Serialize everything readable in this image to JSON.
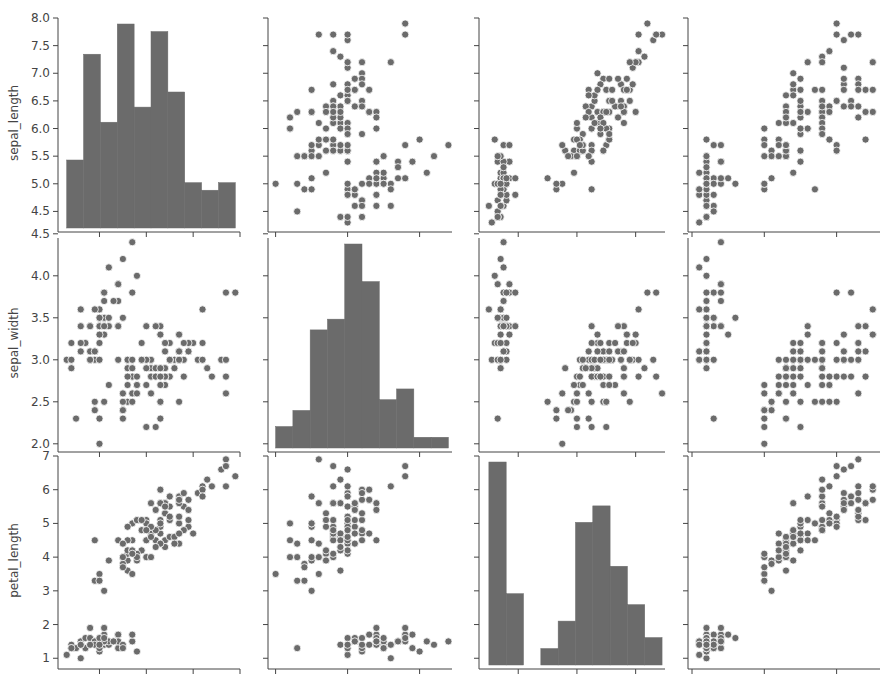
{
  "colors": {
    "bar": "#6b6b6b",
    "marker": "#6b6b6b",
    "marker_edge": "#ffffff",
    "axis": "#444444"
  },
  "chart_data": {
    "type": "pairplot",
    "title": "",
    "rows": [
      "sepal_length",
      "sepal_width",
      "petal_length"
    ],
    "cols": [
      "sepal_length",
      "sepal_width",
      "petal_length",
      "petal_width"
    ],
    "legend": null,
    "grid": false,
    "axes": {
      "sepal_length": {
        "range": [
          4.2,
          8.0
        ],
        "ticks": [
          "4.5",
          "5.0",
          "5.5",
          "6.0",
          "6.5",
          "7.0",
          "7.5",
          "8.0"
        ],
        "xticks": [
          5,
          6,
          7,
          8
        ]
      },
      "sepal_width": {
        "range": [
          1.95,
          4.45
        ],
        "ticks": [
          "2.0",
          "2.5",
          "3.0",
          "3.5",
          "4.0",
          "4.5"
        ],
        "xticks": [
          2,
          3,
          4
        ]
      },
      "petal_length": {
        "range": [
          0.8,
          7.0
        ],
        "ticks": [
          "1",
          "2",
          "3",
          "4",
          "5",
          "6",
          "7"
        ],
        "xticks": [
          2,
          4,
          6
        ]
      },
      "petal_width": {
        "range": [
          0.0,
          2.6
        ],
        "ticks": [],
        "xticks": [
          0,
          1,
          2
        ]
      }
    },
    "histograms": {
      "sepal_length": {
        "bins": [
          4.3,
          4.66,
          5.02,
          5.38,
          5.74,
          6.1,
          6.46,
          6.82,
          7.18,
          7.54,
          7.9
        ],
        "counts": [
          9,
          23,
          14,
          27,
          16,
          26,
          18,
          6,
          5,
          6
        ]
      },
      "sepal_width": {
        "bins": [
          2.0,
          2.24,
          2.48,
          2.72,
          2.96,
          3.2,
          3.44,
          3.68,
          3.92,
          4.16,
          4.4
        ],
        "counts": [
          4,
          7,
          22,
          24,
          38,
          31,
          9,
          11,
          2,
          2
        ]
      },
      "petal_length": {
        "bins": [
          1.0,
          1.59,
          2.18,
          2.77,
          3.36,
          3.95,
          4.54,
          5.13,
          5.72,
          6.31,
          6.9
        ],
        "counts": [
          37,
          13,
          0,
          3,
          8,
          26,
          29,
          18,
          11,
          5
        ]
      }
    },
    "data": {
      "sepal_length": [
        5.1,
        4.9,
        4.7,
        4.6,
        5.0,
        5.4,
        4.6,
        5.0,
        4.4,
        4.9,
        5.4,
        4.8,
        4.8,
        4.3,
        5.8,
        5.7,
        5.4,
        5.1,
        5.7,
        5.1,
        5.4,
        5.1,
        4.6,
        5.1,
        4.8,
        5.0,
        5.0,
        5.2,
        5.2,
        4.7,
        4.8,
        5.4,
        5.2,
        5.5,
        4.9,
        5.0,
        5.5,
        4.9,
        4.4,
        5.1,
        5.0,
        4.5,
        4.4,
        5.0,
        5.1,
        4.8,
        5.1,
        4.6,
        5.3,
        5.0,
        7.0,
        6.4,
        6.9,
        5.5,
        6.5,
        5.7,
        6.3,
        4.9,
        6.6,
        5.2,
        5.0,
        5.9,
        6.0,
        6.1,
        5.6,
        6.7,
        5.6,
        5.8,
        6.2,
        5.6,
        5.9,
        6.1,
        6.3,
        6.1,
        6.4,
        6.6,
        6.8,
        6.7,
        6.0,
        5.7,
        5.5,
        5.5,
        5.8,
        6.0,
        5.4,
        6.0,
        6.7,
        6.3,
        5.6,
        5.5,
        5.5,
        6.1,
        5.8,
        5.0,
        5.6,
        5.7,
        5.7,
        6.2,
        5.1,
        5.7,
        6.3,
        5.8,
        7.1,
        6.3,
        6.5,
        7.6,
        4.9,
        7.3,
        6.7,
        7.2,
        6.5,
        6.4,
        6.8,
        5.7,
        5.8,
        6.4,
        6.5,
        7.7,
        7.7,
        6.0,
        6.9,
        5.6,
        7.7,
        6.3,
        6.7,
        7.2,
        6.2,
        6.1,
        6.4,
        7.2,
        7.4,
        7.9,
        6.4,
        6.3,
        6.1,
        7.7,
        6.3,
        6.4,
        6.0,
        6.9,
        6.7,
        6.9,
        5.8,
        6.8,
        6.7,
        6.7,
        6.3,
        6.5,
        6.2,
        5.9
      ],
      "sepal_width": [
        3.5,
        3.0,
        3.2,
        3.1,
        3.6,
        3.9,
        3.4,
        3.4,
        2.9,
        3.1,
        3.7,
        3.4,
        3.0,
        3.0,
        4.0,
        4.4,
        3.9,
        3.5,
        3.8,
        3.8,
        3.4,
        3.7,
        3.6,
        3.3,
        3.4,
        3.0,
        3.4,
        3.5,
        3.4,
        3.2,
        3.1,
        3.4,
        4.1,
        4.2,
        3.1,
        3.2,
        3.5,
        3.6,
        3.0,
        3.4,
        3.5,
        2.3,
        3.2,
        3.5,
        3.8,
        3.0,
        3.8,
        3.2,
        3.7,
        3.3,
        3.2,
        3.2,
        3.1,
        2.3,
        2.8,
        2.8,
        3.3,
        2.4,
        2.9,
        2.7,
        2.0,
        3.0,
        2.2,
        2.9,
        2.9,
        3.1,
        3.0,
        2.7,
        2.2,
        2.5,
        3.2,
        2.8,
        2.5,
        2.8,
        2.9,
        3.0,
        2.8,
        3.0,
        2.9,
        2.6,
        2.4,
        2.4,
        2.7,
        2.7,
        3.0,
        3.4,
        3.1,
        2.3,
        3.0,
        2.5,
        2.6,
        3.0,
        2.6,
        2.3,
        2.7,
        3.0,
        2.9,
        2.9,
        2.5,
        2.8,
        3.3,
        2.7,
        3.0,
        2.9,
        3.0,
        3.0,
        2.5,
        2.9,
        2.5,
        3.6,
        3.2,
        2.7,
        3.0,
        2.5,
        2.8,
        3.2,
        3.0,
        3.8,
        2.6,
        2.2,
        3.2,
        2.8,
        2.8,
        2.7,
        3.3,
        3.2,
        2.8,
        3.0,
        2.8,
        3.0,
        2.8,
        3.8,
        2.8,
        2.8,
        2.6,
        3.0,
        3.4,
        3.1,
        3.0,
        3.1,
        3.1,
        3.1,
        2.7,
        3.2,
        3.3,
        3.0,
        2.5,
        3.0,
        3.4,
        3.0
      ],
      "petal_length": [
        1.4,
        1.4,
        1.3,
        1.5,
        1.4,
        1.7,
        1.4,
        1.5,
        1.4,
        1.5,
        1.5,
        1.6,
        1.4,
        1.1,
        1.2,
        1.5,
        1.3,
        1.4,
        1.7,
        1.5,
        1.7,
        1.5,
        1.0,
        1.7,
        1.9,
        1.6,
        1.6,
        1.5,
        1.4,
        1.6,
        1.6,
        1.5,
        1.5,
        1.4,
        1.5,
        1.2,
        1.3,
        1.4,
        1.3,
        1.5,
        1.3,
        1.3,
        1.3,
        1.6,
        1.9,
        1.4,
        1.6,
        1.4,
        1.5,
        1.4,
        4.7,
        4.5,
        4.9,
        4.0,
        4.6,
        4.5,
        4.7,
        3.3,
        4.6,
        3.9,
        3.5,
        4.2,
        4.0,
        4.7,
        3.6,
        4.4,
        4.5,
        4.1,
        4.5,
        3.9,
        4.8,
        4.0,
        4.9,
        4.7,
        4.3,
        4.4,
        4.8,
        5.0,
        4.5,
        3.5,
        3.8,
        3.7,
        3.9,
        5.1,
        4.5,
        4.5,
        4.7,
        4.4,
        4.1,
        4.0,
        4.4,
        4.6,
        4.0,
        3.3,
        4.2,
        4.2,
        4.2,
        4.3,
        3.0,
        4.1,
        6.0,
        5.1,
        5.9,
        5.6,
        5.8,
        6.6,
        4.5,
        6.3,
        5.8,
        6.1,
        5.1,
        5.3,
        5.5,
        5.0,
        5.1,
        5.3,
        5.5,
        6.7,
        6.9,
        5.0,
        5.7,
        4.9,
        6.7,
        4.9,
        5.7,
        6.0,
        4.8,
        4.9,
        5.6,
        5.8,
        6.1,
        6.4,
        5.6,
        5.1,
        5.6,
        6.1,
        5.6,
        5.5,
        4.8,
        5.4,
        5.6,
        5.1,
        5.1,
        5.9,
        5.7,
        5.2,
        5.0,
        5.2,
        5.4,
        5.1
      ],
      "petal_width": [
        0.2,
        0.2,
        0.2,
        0.2,
        0.2,
        0.4,
        0.3,
        0.2,
        0.2,
        0.1,
        0.2,
        0.2,
        0.1,
        0.1,
        0.2,
        0.4,
        0.4,
        0.3,
        0.3,
        0.3,
        0.2,
        0.4,
        0.2,
        0.5,
        0.2,
        0.2,
        0.4,
        0.2,
        0.2,
        0.2,
        0.2,
        0.4,
        0.1,
        0.2,
        0.2,
        0.2,
        0.2,
        0.1,
        0.2,
        0.2,
        0.3,
        0.3,
        0.2,
        0.6,
        0.4,
        0.3,
        0.2,
        0.2,
        0.2,
        0.2,
        1.4,
        1.5,
        1.5,
        1.3,
        1.5,
        1.3,
        1.6,
        1.0,
        1.3,
        1.4,
        1.0,
        1.5,
        1.0,
        1.4,
        1.3,
        1.4,
        1.5,
        1.0,
        1.5,
        1.1,
        1.8,
        1.3,
        1.5,
        1.2,
        1.3,
        1.4,
        1.4,
        1.7,
        1.5,
        1.0,
        1.1,
        1.0,
        1.2,
        1.6,
        1.5,
        1.6,
        1.5,
        1.3,
        1.3,
        1.3,
        1.2,
        1.4,
        1.2,
        1.0,
        1.3,
        1.2,
        1.3,
        1.3,
        1.1,
        1.3,
        2.5,
        1.9,
        2.1,
        1.8,
        2.2,
        2.1,
        1.7,
        1.8,
        1.8,
        2.5,
        2.0,
        1.9,
        2.1,
        2.0,
        2.4,
        2.3,
        1.8,
        2.2,
        2.3,
        1.5,
        2.3,
        2.0,
        2.0,
        1.8,
        2.1,
        1.8,
        1.8,
        1.8,
        2.1,
        1.6,
        1.9,
        2.0,
        2.2,
        1.5,
        1.4,
        2.3,
        2.4,
        1.8,
        1.8,
        2.1,
        2.4,
        2.3,
        1.9,
        2.3,
        2.5,
        2.3,
        1.9,
        2.0,
        2.3,
        1.8
      ]
    }
  }
}
